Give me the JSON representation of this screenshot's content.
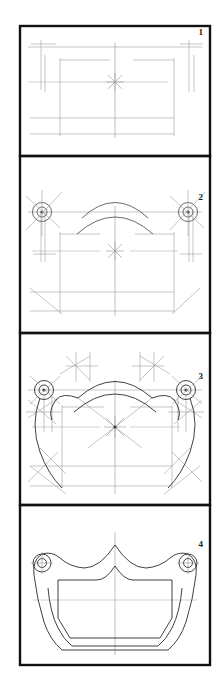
{
  "document": {
    "kind": "technical-drawing-steps",
    "title": "Four-step geometric construction of a drawer-pull / handle plate",
    "background_color": "#ffffff",
    "frame_color": "#111111",
    "construction_line_color": "#9aa0a6",
    "centerline_color": "#b0b4b8",
    "object_line_color": "#2b2b2b"
  },
  "panels": [
    {
      "number": "1",
      "label_x": 203,
      "label_y": 35,
      "caption": "Step 1 - layout of centre lines and bounding rectangle",
      "box": {
        "x": 20,
        "y": 26,
        "w": 190,
        "h": 130
      }
    },
    {
      "number": "2",
      "label_x": 203,
      "label_y": 200,
      "caption": "Step 2 - boss circles, top arcs and chamfer lines added",
      "box": {
        "x": 20,
        "y": 156,
        "w": 190,
        "h": 177
      }
    },
    {
      "number": "3",
      "label_x": 203,
      "label_y": 379,
      "caption": "Step 3 - tangent arcs, radii and fillet construction",
      "box": {
        "x": 20,
        "y": 333,
        "w": 190,
        "h": 172
      }
    },
    {
      "number": "4",
      "label_x": 203,
      "label_y": 547,
      "caption": "Step 4 - finished outline with two fixing holes",
      "box": {
        "x": 20,
        "y": 505,
        "w": 190,
        "h": 160
      }
    }
  ],
  "features": {
    "fixing_hole_left": {
      "cx": 42,
      "cy": 563,
      "r_outer": 9,
      "r_inner": 4.5
    },
    "fixing_hole_right": {
      "cx": 188,
      "cy": 563,
      "r_outer": 9,
      "r_inner": 4.5
    },
    "boss_left_step2": {
      "cx": 42,
      "cy": 212,
      "r_outer": 9.5,
      "r_mid": 5.5,
      "r_inner": 2
    },
    "boss_right_step2": {
      "cx": 188,
      "cy": 212,
      "r_outer": 9.5,
      "r_mid": 5.5,
      "r_inner": 2
    },
    "boss_left_step3": {
      "cx": 44,
      "cy": 390,
      "r_outer": 9.5,
      "r_mid": 5.5,
      "r_inner": 2
    },
    "boss_right_step3": {
      "cx": 186,
      "cy": 390,
      "r_outer": 9.5,
      "r_mid": 5.5,
      "r_inner": 2
    },
    "centre_mark_step1": {
      "cx": 115,
      "cy": 82
    },
    "centre_mark_step2": {
      "cx": 115,
      "cy": 251
    },
    "centre_mark_step3": {
      "cx": 115,
      "cy": 427
    },
    "vertical_centreline_x": 115
  }
}
